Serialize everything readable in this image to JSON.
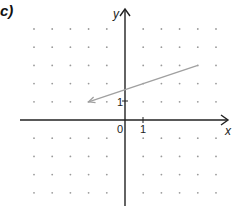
{
  "panel_label": "c)",
  "axes": {
    "x_label": "x",
    "y_label": "y",
    "origin_label": "0",
    "x_unit_label": "1",
    "y_unit_label": "1",
    "x_range": [
      -5,
      5
    ],
    "y_range": [
      -4,
      5
    ]
  },
  "grid": {
    "type": "dot",
    "spacing": 1
  },
  "vector": {
    "from": [
      4,
      3
    ],
    "to": [
      -2,
      1
    ],
    "color": "#a0a0a0"
  },
  "colors": {
    "axis": "#222222",
    "dots": "#9a9a9a",
    "vector": "#a0a0a0"
  }
}
